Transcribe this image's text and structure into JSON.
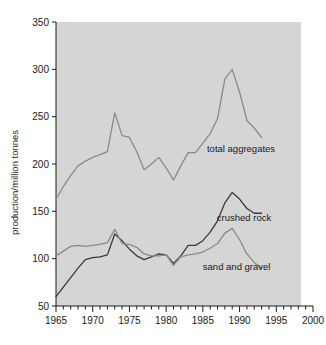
{
  "chart_data": {
    "type": "line",
    "title": "",
    "subtitle": "",
    "xlabel": "",
    "ylabel": "production/million tonnes",
    "xlim": [
      1965,
      2000
    ],
    "ylim": [
      50,
      350
    ],
    "xticks": [
      1965,
      1970,
      1975,
      1980,
      1985,
      1990,
      1995,
      2000
    ],
    "yticks": [
      50,
      100,
      150,
      200,
      250,
      300,
      350
    ],
    "minor_x_tick_step": 1,
    "grid": false,
    "legend_position": "inline-annotations",
    "plot_background": "#d5d5d5",
    "x": [
      1965,
      1966,
      1967,
      1968,
      1969,
      1970,
      1971,
      1972,
      1973,
      1974,
      1975,
      1976,
      1977,
      1978,
      1979,
      1980,
      1981,
      1982,
      1983,
      1984,
      1985,
      1986,
      1987,
      1988,
      1989,
      1990,
      1991,
      1992,
      1993
    ],
    "series": [
      {
        "name": "total aggregates",
        "color": "#8a8a8a",
        "label": "total aggregates",
        "label_x": 1990.2,
        "label_y": 216,
        "values": [
          163,
          176,
          188,
          198,
          203,
          207,
          210,
          213,
          254,
          230,
          228,
          213,
          194,
          200,
          207,
          196,
          183,
          198,
          212,
          212,
          222,
          232,
          248,
          290,
          300,
          276,
          246,
          238,
          228
        ]
      },
      {
        "name": "crushed rock",
        "color": "#3a3a3a",
        "label": "crushed rock",
        "label_x": 1990.6,
        "label_y": 143,
        "values": [
          60,
          70,
          80,
          90,
          99,
          101,
          102,
          104,
          126,
          119,
          110,
          103,
          99,
          102,
          105,
          104,
          95,
          103,
          114,
          114,
          119,
          128,
          140,
          159,
          170,
          163,
          153,
          148,
          148
        ]
      },
      {
        "name": "sand and gravel",
        "color": "#8a8a8a",
        "label": "sand and gravel",
        "label_x": 1989.6,
        "label_y": 92,
        "values": [
          103,
          108,
          113,
          114,
          113,
          114,
          115,
          117,
          131,
          116,
          115,
          112,
          105,
          103,
          103,
          104,
          93,
          102,
          104,
          105,
          107,
          111,
          116,
          127,
          132,
          120,
          105,
          96,
          90
        ]
      }
    ]
  },
  "axis": {
    "y_title": "production/million tonnes",
    "y_tick_labels": [
      "350",
      "300",
      "250",
      "200",
      "150",
      "100",
      "50"
    ],
    "x_tick_labels": [
      "1965",
      "1970",
      "1975",
      "1980",
      "1985",
      "1990",
      "1995",
      "2000"
    ]
  },
  "annotations": {
    "total_aggregates": "total aggregates",
    "crushed_rock": "crushed rock",
    "sand_and_gravel": "sand and gravel"
  }
}
